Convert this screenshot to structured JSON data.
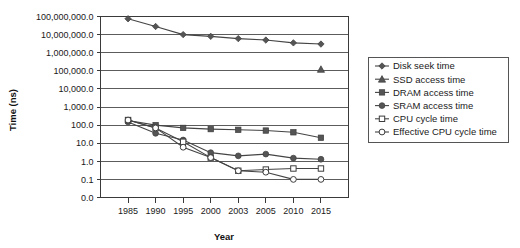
{
  "chart_data": {
    "type": "line",
    "title": "",
    "xlabel": "Year",
    "ylabel": "Time (ns)",
    "x": [
      "1985",
      "1990",
      "1995",
      "2000",
      "2003",
      "2005",
      "2010",
      "2015"
    ],
    "categories": [
      "1985",
      "1990",
      "1995",
      "2000",
      "2003",
      "2005",
      "2010",
      "2015"
    ],
    "yscale": "log",
    "ylim": [
      0.1,
      100000000.0
    ],
    "ytick_labels": [
      "100,000,000.0",
      "10,000,000.0",
      "1,000,000.0",
      "100,000.0",
      "10,000.0",
      "1,000.0",
      "100.0",
      "10.0",
      "1.0",
      "0.1",
      "0.0"
    ],
    "ytick_values": [
      100000000.0,
      10000000.0,
      1000000.0,
      100000.0,
      10000.0,
      1000.0,
      100.0,
      10.0,
      1.0,
      0.1,
      0.0
    ],
    "grid": true,
    "legend_position": "right",
    "series": [
      {
        "name": "Disk seek time",
        "marker": "filled-diamond",
        "x": [
          "1985",
          "1990",
          "1995",
          "2000",
          "2003",
          "2005",
          "2010",
          "2015"
        ],
        "values": [
          75000000,
          28000000,
          10000000,
          8000000,
          6000000,
          5000000,
          3500000,
          3000000
        ]
      },
      {
        "name": "SSD access time",
        "marker": "filled-triangle",
        "x": [
          "2015"
        ],
        "values": [
          120000
        ]
      },
      {
        "name": "DRAM access time",
        "marker": "filled-square",
        "x": [
          "1985",
          "1990",
          "1995",
          "2000",
          "2003",
          "2005",
          "2010",
          "2015"
        ],
        "values": [
          180,
          100,
          70,
          60,
          55,
          50,
          40,
          20
        ]
      },
      {
        "name": "SRAM access time",
        "marker": "filled-circle",
        "x": [
          "1985",
          "1990",
          "1995",
          "2000",
          "2003",
          "2005",
          "2010",
          "2015"
        ],
        "values": [
          150,
          35,
          15,
          3,
          2,
          2.5,
          1.5,
          1.3
        ]
      },
      {
        "name": "CPU cycle time",
        "marker": "open-square",
        "x": [
          "1985",
          "1990",
          "1995",
          "2000",
          "2003",
          "2005",
          "2010",
          "2015"
        ],
        "values": [
          190,
          70,
          12,
          1.6,
          0.3,
          0.35,
          0.4,
          0.4
        ]
      },
      {
        "name": "Effective CPU cycle time",
        "marker": "open-circle",
        "x": [
          "1985",
          "1990",
          "1995",
          "2000",
          "2003",
          "2005",
          "2010",
          "2015"
        ],
        "values": [
          190,
          70,
          6,
          1.6,
          0.3,
          0.25,
          0.1,
          0.1
        ]
      }
    ]
  },
  "legend": {
    "items": [
      {
        "label": "Disk seek time",
        "marker": "filled-diamond"
      },
      {
        "label": "SSD access time",
        "marker": "filled-triangle"
      },
      {
        "label": "DRAM access time",
        "marker": "filled-square"
      },
      {
        "label": "SRAM access time",
        "marker": "filled-circle"
      },
      {
        "label": "CPU cycle time",
        "marker": "open-square"
      },
      {
        "label": "Effective CPU cycle time",
        "marker": "open-circle"
      }
    ]
  },
  "colors": {
    "background": "#ffffff",
    "grid": "#4a4a4a",
    "line": "#444444",
    "marker_fill": "#555555",
    "marker_open": "#ffffff",
    "text": "#1a1a1a"
  }
}
